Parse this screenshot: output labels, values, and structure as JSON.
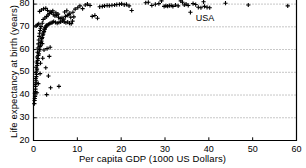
{
  "chart_data": {
    "type": "scatter",
    "title": "",
    "xlabel": "Per capita GDP (1000 US Dollars)",
    "ylabel": "Life expectancy at birth (years)",
    "xlim": [
      0,
      60
    ],
    "ylim": [
      20,
      84
    ],
    "xticks": [
      0,
      10,
      20,
      30,
      40,
      50,
      60
    ],
    "yticks": [
      20,
      30,
      40,
      50,
      60,
      70,
      80
    ],
    "xtick_labels": [
      "0",
      "10",
      "20",
      "30",
      "40",
      "50",
      "60"
    ],
    "ytick_labels": [
      "20",
      "30",
      "40",
      "50",
      "60",
      "70",
      "80"
    ],
    "grid": "horizontal-dotted",
    "legend": "none",
    "marker": "plus",
    "marker_color": "#000000",
    "annotations": [
      {
        "text": "USA",
        "x": 39.5,
        "y": 73.5
      }
    ],
    "points": [
      [
        0.2,
        36.2
      ],
      [
        0.25,
        37.6
      ],
      [
        0.3,
        38.5
      ],
      [
        0.35,
        39.4
      ],
      [
        0.3,
        40.8
      ],
      [
        0.4,
        41.5
      ],
      [
        0.45,
        42.6
      ],
      [
        0.5,
        43.8
      ],
      [
        0.4,
        44.6
      ],
      [
        0.55,
        45.4
      ],
      [
        0.6,
        46.3
      ],
      [
        0.5,
        47.2
      ],
      [
        0.65,
        48.1
      ],
      [
        0.7,
        49.0
      ],
      [
        0.55,
        49.8
      ],
      [
        0.75,
        50.6
      ],
      [
        0.8,
        51.4
      ],
      [
        0.6,
        52.2
      ],
      [
        0.85,
        53.0
      ],
      [
        0.9,
        53.8
      ],
      [
        0.7,
        54.5
      ],
      [
        0.95,
        55.2
      ],
      [
        1.0,
        56.0
      ],
      [
        0.8,
        56.7
      ],
      [
        1.1,
        57.4
      ],
      [
        1.2,
        58.1
      ],
      [
        0.9,
        58.8
      ],
      [
        1.3,
        59.4
      ],
      [
        1.4,
        60.1
      ],
      [
        1.0,
        60.7
      ],
      [
        1.5,
        61.3
      ],
      [
        1.6,
        61.9
      ],
      [
        1.1,
        62.5
      ],
      [
        1.7,
        63.1
      ],
      [
        1.8,
        63.7
      ],
      [
        1.2,
        64.2
      ],
      [
        1.9,
        64.8
      ],
      [
        2.0,
        65.3
      ],
      [
        1.3,
        65.8
      ],
      [
        2.1,
        66.3
      ],
      [
        2.2,
        66.8
      ],
      [
        1.4,
        67.2
      ],
      [
        2.3,
        67.6
      ],
      [
        2.4,
        68.0
      ],
      [
        1.5,
        68.4
      ],
      [
        2.5,
        68.8
      ],
      [
        2.6,
        69.1
      ],
      [
        1.6,
        69.4
      ],
      [
        2.7,
        69.7
      ],
      [
        2.8,
        70.0
      ],
      [
        1.7,
        70.2
      ],
      [
        0.6,
        70.4
      ],
      [
        0.9,
        70.9
      ],
      [
        1.2,
        71.3
      ],
      [
        2.0,
        71.6
      ],
      [
        2.9,
        70.5
      ],
      [
        3.1,
        70.8
      ],
      [
        3.4,
        71.1
      ],
      [
        3.7,
        71.4
      ],
      [
        4.0,
        71.7
      ],
      [
        4.3,
        72.0
      ],
      [
        4.6,
        72.3
      ],
      [
        5.0,
        72.0
      ],
      [
        5.4,
        71.6
      ],
      [
        5.8,
        71.9
      ],
      [
        6.2,
        72.2
      ],
      [
        6.6,
        72.6
      ],
      [
        7.0,
        72.2
      ],
      [
        7.4,
        71.8
      ],
      [
        7.8,
        72.1
      ],
      [
        8.2,
        71.6
      ],
      [
        8.6,
        71.4
      ],
      [
        8.9,
        72.5
      ],
      [
        9.2,
        74.4
      ],
      [
        2.2,
        73.2
      ],
      [
        2.6,
        73.9
      ],
      [
        3.0,
        74.5
      ],
      [
        3.3,
        75.2
      ],
      [
        3.6,
        75.8
      ],
      [
        4.1,
        76.3
      ],
      [
        4.5,
        75.5
      ],
      [
        4.9,
        74.8
      ],
      [
        5.3,
        75.1
      ],
      [
        5.7,
        74.2
      ],
      [
        6.1,
        73.6
      ],
      [
        6.5,
        74.0
      ],
      [
        6.9,
        73.4
      ],
      [
        7.3,
        74.6
      ],
      [
        7.7,
        75.0
      ],
      [
        8.1,
        75.4
      ],
      [
        8.5,
        74.2
      ],
      [
        1.4,
        76.8
      ],
      [
        1.8,
        77.4
      ],
      [
        2.3,
        77.9
      ],
      [
        2.8,
        78.1
      ],
      [
        3.2,
        77.2
      ],
      [
        3.8,
        76.6
      ],
      [
        4.4,
        77.0
      ],
      [
        5.1,
        76.2
      ],
      [
        5.6,
        75.6
      ],
      [
        7.1,
        76.5
      ],
      [
        7.6,
        77.1
      ],
      [
        8.3,
        76.0
      ],
      [
        9.0,
        76.4
      ],
      [
        9.5,
        77.8
      ],
      [
        10.1,
        78.4
      ],
      [
        10.6,
        79.2
      ],
      [
        11.2,
        78.0
      ],
      [
        11.8,
        79.6
      ],
      [
        12.3,
        80.0
      ],
      [
        12.9,
        79.4
      ],
      [
        13.4,
        74.6
      ],
      [
        14.0,
        75.0
      ],
      [
        14.6,
        73.8
      ],
      [
        15.1,
        78.8
      ],
      [
        15.7,
        79.0
      ],
      [
        16.2,
        79.2
      ],
      [
        16.8,
        79.4
      ],
      [
        17.3,
        79.3
      ],
      [
        17.9,
        79.5
      ],
      [
        18.5,
        79.6
      ],
      [
        19.0,
        79.8
      ],
      [
        19.6,
        79.9
      ],
      [
        20.1,
        80.1
      ],
      [
        20.7,
        79.7
      ],
      [
        21.2,
        79.9
      ],
      [
        21.8,
        79.2
      ],
      [
        22.4,
        77.2
      ],
      [
        25.6,
        80.6
      ],
      [
        26.2,
        80.8
      ],
      [
        27.0,
        79.4
      ],
      [
        27.8,
        79.9
      ],
      [
        28.6,
        80.2
      ],
      [
        29.2,
        81.4
      ],
      [
        29.8,
        79.0
      ],
      [
        30.2,
        79.2
      ],
      [
        30.6,
        79.1
      ],
      [
        31.0,
        79.3
      ],
      [
        31.4,
        79.4
      ],
      [
        31.8,
        79.0
      ],
      [
        32.4,
        79.6
      ],
      [
        33.0,
        79.2
      ],
      [
        33.6,
        81.4
      ],
      [
        34.0,
        80.8
      ],
      [
        34.4,
        79.6
      ],
      [
        34.8,
        80.0
      ],
      [
        35.3,
        79.4
      ],
      [
        35.8,
        76.4
      ],
      [
        36.4,
        80.2
      ],
      [
        37.0,
        79.8
      ],
      [
        37.6,
        78.6
      ],
      [
        38.2,
        78.4
      ],
      [
        38.8,
        81.0
      ],
      [
        39.0,
        79.0
      ],
      [
        39.6,
        78.6
      ],
      [
        40.2,
        78.4
      ],
      [
        43.8,
        80.4
      ],
      [
        49.0,
        79.6
      ],
      [
        58.0,
        79.2
      ],
      [
        3.0,
        40.2
      ],
      [
        3.9,
        43.2
      ],
      [
        5.8,
        43.8
      ],
      [
        3.4,
        48.4
      ],
      [
        2.8,
        52.0
      ],
      [
        3.6,
        57.0
      ],
      [
        2.4,
        59.8
      ],
      [
        3.1,
        60.4
      ],
      [
        3.8,
        61.0
      ],
      [
        2.0,
        62.6
      ],
      [
        1.6,
        54.0
      ],
      [
        1.1,
        45.0
      ],
      [
        0.8,
        41.0
      ],
      [
        1.5,
        49.4
      ],
      [
        2.1,
        56.2
      ]
    ]
  }
}
